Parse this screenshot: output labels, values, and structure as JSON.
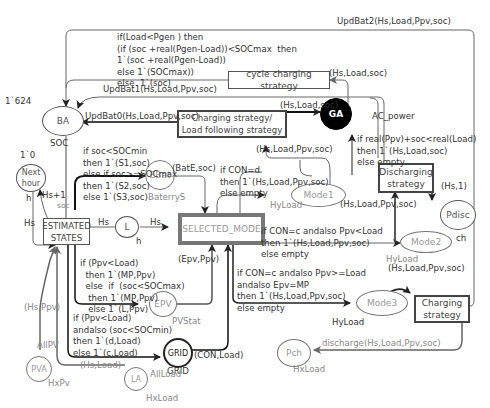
{
  "places": {
    "BA": {
      "label": "BA",
      "initial": "1`624",
      "type": "SOC"
    },
    "next_hour": {
      "label": "Next\nhour",
      "initial": "1`0",
      "type": "h"
    },
    "EBat": {
      "label": "EBat",
      "type": "BaterryS"
    },
    "L": {
      "label": "L",
      "type": "h"
    },
    "EPV": {
      "label": "EPV",
      "type": "PVStat"
    },
    "GRID": {
      "label": "GRID",
      "type": "GRID"
    },
    "PVA": {
      "label": "PVA",
      "type": "HxPv",
      "fusion": "AllPV"
    },
    "LA": {
      "label": "LA",
      "type": "HxLoad",
      "fusion": "AllLoad"
    },
    "GA": {
      "label": "GA",
      "type": "AC_power"
    },
    "Mode1": {
      "label": "Mode1",
      "type": "HyLoad"
    },
    "Mode2": {
      "label": "Mode2",
      "type": "HyLoad"
    },
    "Mode3": {
      "label": "Mode3",
      "type": "HyLoad"
    },
    "Pdisc": {
      "label": "Pdisc",
      "type": "ch"
    },
    "Pch": {
      "label": "Pch",
      "type": "HxLoad"
    }
  },
  "transitions": {
    "estimated_states": "ESTIMATED\nSTATES",
    "selected_mode": "SELECTED_MODE",
    "charging_load_following": "Charging strategy/\nLoad following strategy",
    "cycle_charging": "cycle charging strategy",
    "discharging": "Discharging\nstrategy",
    "charging": "Charging\nstrategy"
  },
  "arcs": {
    "upd_bat2": "UpdBat2(Hs,Load,Ppv,soc)",
    "cycle_to_ba": "if(Load<Pgen ) then\n(if (soc +real(Pgen-Load))<SOCmax  then\n1`(soc +real(Pgen-Load))\nelse 1`(SOCmax))\nelse  1`(soc)",
    "upd_bat1": "UpdBat1(Hs,Load,Ppv,soc)",
    "upd_bat0": "UpdBat0(Hs,Load,Ppv,soc)",
    "ga_to_cycle": "(Hs,Load,soc)",
    "clf_to_ga": "(Hs,Load,soc)",
    "mode1_to_clf": "(Hs,Load,Ppv,soc)",
    "discharge_to_ga": "if real(Ppv)+soc<real(Load)\nthen 1`(Hs,Load,soc)\nelse empty",
    "hs_plus_1": "Hs+1",
    "h_lbl": "h",
    "hs_lbl": "Hs",
    "soc_lbl": "soc",
    "est_to_ebat": "if soc<SOCmin\nthen 1`(S1,soc)\nelse if soc>=SOCmax\nthen 1`(S2,soc)\nelse 1`(S3,soc)",
    "ebat_to_mode": "(BatE,soc)",
    "est_to_l": "Hs",
    "l_to_mode": "Hs",
    "sel_to_mode1": "if CON=d\nthen 1`(Hs,Load,Ppv,soc)\nelse empty",
    "mode1_to_discharge": "(Hs,Load,Ppv,soc)",
    "discharge_to_pdisc": "(Hs,1)",
    "sel_to_mode2": "if CON=c andalso Ppv<Load\nthen 1`(Hs,Load,Ppv,soc)\nelse empty",
    "mode2_out": "(Hs,Load,Ppv,soc)",
    "epv_to_mode": "(Epv,Ppv)",
    "est_to_epv": "if (Ppv<Load)\n  then 1`(MP,Ppv)\n  else  if  (soc<SOCmax)\n   then 1`(MP,Ppv)\n   else 1`(L,Ppv)",
    "sel_to_mode3": "if CON=c andalso Ppv>=Load\nandalso Epv=MP\nthen 1`(Hs,Load,Ppv,soc)\nelse empty",
    "pva_to_est": "(Hs,Ppv)",
    "est_to_grid": "if (Ppv<Load)\nandalso (soc<SOCmin)\nthen 1`(d,Load)\nelse 1`(c,Load)",
    "grid_to_mode": "(CON,Load)",
    "la_to_est": "(Hs,Load)",
    "charging_to_pch": "discharge(Hs,Load,Ppv,soc)"
  }
}
